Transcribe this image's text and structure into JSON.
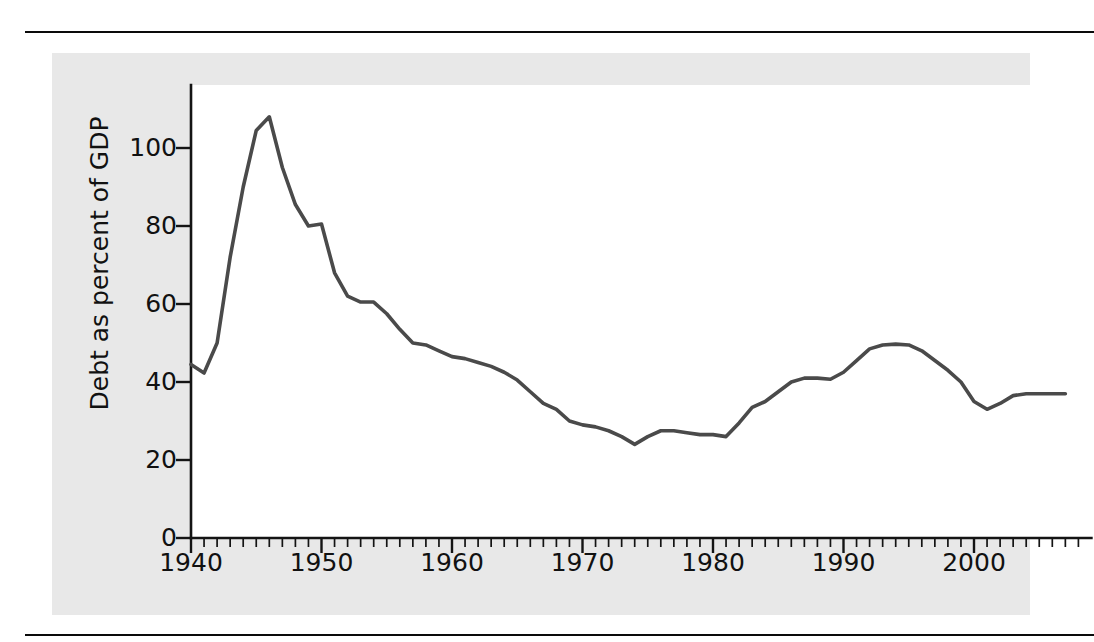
{
  "figure": {
    "background_color": "#e8e8e8",
    "plot_background_color": "#ffffff",
    "rule_color": "#0a0a0a"
  },
  "chart_data": {
    "type": "line",
    "title": "",
    "xlabel": "",
    "ylabel": "Debt as percent of GDP",
    "xlim": [
      1940,
      2008
    ],
    "ylim": [
      0,
      113
    ],
    "grid": false,
    "legend": null,
    "line_color": "#4a4a4a",
    "y_ticks": [
      0,
      20,
      40,
      60,
      80,
      100
    ],
    "y_tick_labels": [
      "0",
      "20",
      "40",
      "60",
      "80",
      "100"
    ],
    "x_ticks": [
      1940,
      1950,
      1960,
      1970,
      1980,
      1990,
      2000
    ],
    "x_tick_labels": [
      "1940",
      "1950",
      "1960",
      "1970",
      "1980",
      "1990",
      "2000"
    ],
    "x_minor_tick_interval": 1,
    "series": [
      {
        "name": "Debt as percent of GDP",
        "x": [
          1940,
          1941,
          1942,
          1943,
          1944,
          1945,
          1946,
          1947,
          1948,
          1949,
          1950,
          1951,
          1952,
          1953,
          1954,
          1955,
          1956,
          1957,
          1958,
          1959,
          1960,
          1961,
          1962,
          1963,
          1964,
          1965,
          1966,
          1967,
          1968,
          1969,
          1970,
          1971,
          1972,
          1973,
          1974,
          1975,
          1976,
          1977,
          1978,
          1979,
          1980,
          1981,
          1982,
          1983,
          1984,
          1985,
          1986,
          1987,
          1988,
          1989,
          1990,
          1991,
          1992,
          1993,
          1994,
          1995,
          1996,
          1997,
          1998,
          1999,
          2000,
          2001,
          2002,
          2003,
          2004,
          2005,
          2006,
          2007
        ],
        "values": [
          44.5,
          42.3,
          50.0,
          72.0,
          90.0,
          104.5,
          108.0,
          95.0,
          85.5,
          80.0,
          80.5,
          68.0,
          62.0,
          60.5,
          60.5,
          57.5,
          53.5,
          50.0,
          49.5,
          48.0,
          46.5,
          46.0,
          45.0,
          44.0,
          42.5,
          40.5,
          37.5,
          34.5,
          33.0,
          30.0,
          29.0,
          28.5,
          27.5,
          26.0,
          24.0,
          26.0,
          27.5,
          27.5,
          27.0,
          26.5,
          26.5,
          26.0,
          29.5,
          33.5,
          35.0,
          37.5,
          40.0,
          41.0,
          41.0,
          40.7,
          42.5,
          45.5,
          48.5,
          49.5,
          49.7,
          49.5,
          48.0,
          45.5,
          43.0,
          40.0,
          35.0,
          33.0,
          34.5,
          36.5,
          37.0,
          37.0,
          37.0,
          37.0
        ]
      }
    ]
  }
}
